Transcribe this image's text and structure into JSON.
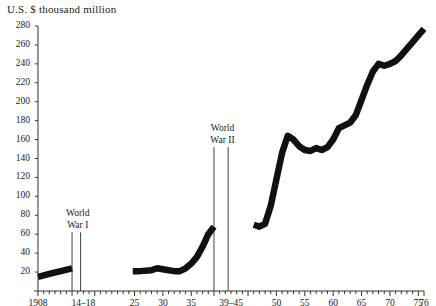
{
  "chart_data": {
    "type": "line",
    "title": "U.S. $ thousand million",
    "xlabel": "",
    "ylabel": "U.S. $ thousand million",
    "ylim": [
      0,
      288
    ],
    "xlim": [
      1908,
      1976
    ],
    "grid": false,
    "legend": null,
    "y_ticks": [
      20,
      40,
      60,
      80,
      100,
      120,
      140,
      160,
      180,
      200,
      220,
      240,
      260,
      280
    ],
    "y_tick_labels": [
      "20",
      "40",
      "60",
      "80",
      "100",
      "120",
      "140",
      "160",
      "180",
      "200",
      "220",
      "240",
      "260",
      "280"
    ],
    "x_ticks": [
      1908,
      1914,
      1918,
      1925,
      1930,
      1935,
      1939,
      1945,
      1950,
      1955,
      1960,
      1965,
      1970,
      1975,
      1976
    ],
    "x_tick_labels": [
      {
        "value": 1908,
        "label": "1908"
      },
      {
        "value": 1916,
        "label": "14–18"
      },
      {
        "value": 1925,
        "label": "25"
      },
      {
        "value": 1930,
        "label": "30"
      },
      {
        "value": 1935,
        "label": "35"
      },
      {
        "value": 1942,
        "label": "39–45"
      },
      {
        "value": 1950,
        "label": "50"
      },
      {
        "value": 1955,
        "label": "55"
      },
      {
        "value": 1960,
        "label": "60"
      },
      {
        "value": 1965,
        "label": "65"
      },
      {
        "value": 1970,
        "label": "70"
      },
      {
        "value": 1975,
        "label": "75"
      },
      {
        "value": 1976,
        "label": "76"
      }
    ],
    "annotations": [
      {
        "name": "world-war-i",
        "text_line1": "World",
        "text_line2": "War I",
        "x": 1915,
        "start_year": 1914,
        "end_year": 1915.5
      },
      {
        "name": "world-war-ii",
        "text_line1": "World",
        "text_line2": "War II",
        "x": 1940.5,
        "start_year": 1939,
        "end_year": 1941.5
      }
    ],
    "series": [
      {
        "name": "segment-pre-ww1",
        "points": [
          {
            "x": 1908,
            "y": 15
          },
          {
            "x": 1910,
            "y": 18
          },
          {
            "x": 1912,
            "y": 21
          },
          {
            "x": 1914,
            "y": 24
          }
        ]
      },
      {
        "name": "segment-interwar",
        "points": [
          {
            "x": 1924.7,
            "y": 21
          },
          {
            "x": 1926,
            "y": 21
          },
          {
            "x": 1928,
            "y": 22
          },
          {
            "x": 1929,
            "y": 24
          },
          {
            "x": 1930,
            "y": 23
          },
          {
            "x": 1931,
            "y": 22
          },
          {
            "x": 1932,
            "y": 21
          },
          {
            "x": 1933,
            "y": 21
          },
          {
            "x": 1934,
            "y": 24
          },
          {
            "x": 1935,
            "y": 29
          },
          {
            "x": 1936,
            "y": 36
          },
          {
            "x": 1937,
            "y": 47
          },
          {
            "x": 1938,
            "y": 60
          },
          {
            "x": 1939,
            "y": 68
          }
        ]
      },
      {
        "name": "segment-postwar",
        "points": [
          {
            "x": 1946,
            "y": 70
          },
          {
            "x": 1947,
            "y": 68
          },
          {
            "x": 1948,
            "y": 71
          },
          {
            "x": 1949,
            "y": 90
          },
          {
            "x": 1950,
            "y": 118
          },
          {
            "x": 1951,
            "y": 146
          },
          {
            "x": 1952,
            "y": 164
          },
          {
            "x": 1953,
            "y": 160
          },
          {
            "x": 1954,
            "y": 153
          },
          {
            "x": 1955,
            "y": 149
          },
          {
            "x": 1956,
            "y": 148
          },
          {
            "x": 1957,
            "y": 151
          },
          {
            "x": 1958,
            "y": 149
          },
          {
            "x": 1959,
            "y": 152
          },
          {
            "x": 1960,
            "y": 160
          },
          {
            "x": 1961,
            "y": 172
          },
          {
            "x": 1962,
            "y": 175
          },
          {
            "x": 1963,
            "y": 178
          },
          {
            "x": 1964,
            "y": 186
          },
          {
            "x": 1965,
            "y": 202
          },
          {
            "x": 1966,
            "y": 218
          },
          {
            "x": 1967,
            "y": 232
          },
          {
            "x": 1968,
            "y": 240
          },
          {
            "x": 1969,
            "y": 238
          },
          {
            "x": 1970,
            "y": 240
          },
          {
            "x": 1971,
            "y": 243
          },
          {
            "x": 1972,
            "y": 249
          },
          {
            "x": 1973,
            "y": 256
          },
          {
            "x": 1974,
            "y": 263
          },
          {
            "x": 1975,
            "y": 270
          },
          {
            "x": 1976,
            "y": 277
          }
        ]
      }
    ]
  }
}
